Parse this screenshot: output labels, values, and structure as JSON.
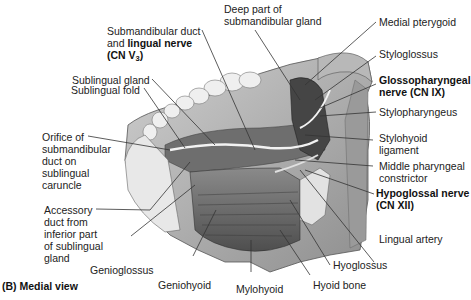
{
  "figure": {
    "panel_label": "(B) Medial view",
    "colors": {
      "background": "#ffffff",
      "illustration_dark": "#3a3a3a",
      "illustration_mid": "#7a7a7a",
      "illustration_light": "#d6d6d6",
      "leader_line": "#333333",
      "text": "#1a1a1a"
    },
    "labels": {
      "submandibular_duct_1": "Submandibular duct",
      "submandibular_duct_2_prefix": "and ",
      "submandibular_duct_2_bold": "lingual nerve",
      "submandibular_duct_3": "(CN V",
      "submandibular_duct_3_sub": "3",
      "submandibular_duct_3_close": ")",
      "deep_part_1": "Deep part of",
      "deep_part_2": "submandibular gland",
      "sublingual_gland": "Sublingual gland",
      "sublingual_fold": "Sublingual fold",
      "orifice_1": "Orifice of",
      "orifice_2": "submandibular",
      "orifice_3": "duct on",
      "orifice_4": "sublingual",
      "orifice_5": "caruncle",
      "accessory_1": "Accessory",
      "accessory_2": "duct from",
      "accessory_3": "inferior part",
      "accessory_4": "of sublingual",
      "accessory_5": "gland",
      "genioglossus": "Genioglossus",
      "geniohyoid": "Geniohyoid",
      "mylohyoid": "Mylohyoid",
      "hyoid_bone": "Hyoid bone",
      "hyoglossus": "Hyoglossus",
      "lingual_artery": "Lingual artery",
      "hypoglossal_1": "Hypoglossal nerve",
      "hypoglossal_2": "(CN XII)",
      "middle_pharyngeal_1": "Middle pharyngeal",
      "middle_pharyngeal_2": "constrictor",
      "stylohyoid_1": "Stylohyoid",
      "stylohyoid_2": "ligament",
      "stylopharyngeus": "Stylopharyngeus",
      "glossopharyngeal_1": "Glossopharyngeal",
      "glossopharyngeal_2": "nerve (CN IX)",
      "styloglossus": "Styloglossus",
      "medial_pterygoid": "Medial pterygoid"
    }
  }
}
